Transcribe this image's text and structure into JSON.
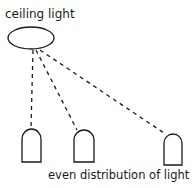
{
  "diagram": {
    "title_label": "ceiling light",
    "caption": "even distribution of light",
    "colors": {
      "stroke": "#1a1a1a",
      "background": "#ffffff"
    },
    "light_source": {
      "name": "ceiling light",
      "shape": "ellipse",
      "cx": 31,
      "cy": 38,
      "rx": 23,
      "ry": 11
    },
    "rays": [
      {
        "x1": 33,
        "y1": 50,
        "x2": 31,
        "y2": 128
      },
      {
        "x1": 36,
        "y1": 50,
        "x2": 77,
        "y2": 130
      },
      {
        "x1": 40,
        "y1": 50,
        "x2": 164,
        "y2": 133
      }
    ],
    "receivers": [
      {
        "name": "object-1",
        "x": 22,
        "top": 129,
        "width": 19,
        "bottom": 162
      },
      {
        "name": "object-2",
        "x": 74,
        "top": 130,
        "width": 20,
        "bottom": 162
      },
      {
        "name": "object-3",
        "x": 164,
        "top": 134,
        "width": 18,
        "bottom": 165
      }
    ]
  }
}
